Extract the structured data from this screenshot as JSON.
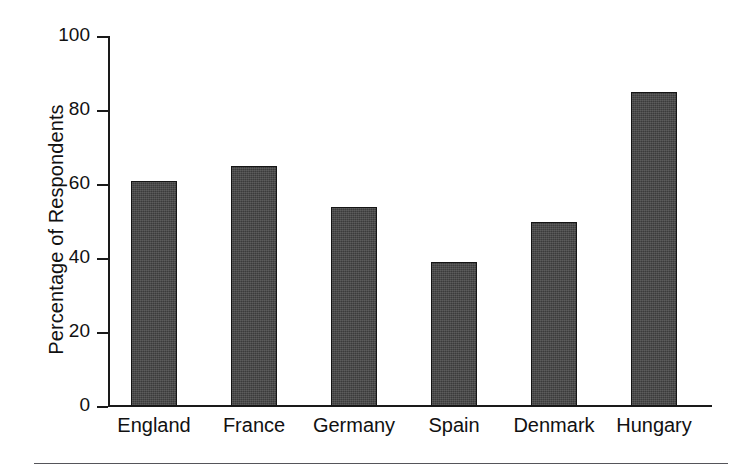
{
  "chart_data": {
    "type": "bar",
    "title": "",
    "xlabel": "",
    "ylabel": "Percentage of Respondents",
    "categories": [
      "England",
      "France",
      "Germany",
      "Spain",
      "Denmark",
      "Hungary"
    ],
    "values": [
      61,
      65,
      54,
      39,
      50,
      85
    ],
    "ylim": [
      0,
      100
    ],
    "yticks": [
      0,
      20,
      40,
      60,
      80,
      100
    ],
    "ytick_labels": [
      "0",
      "20",
      "40",
      "60",
      "80",
      "100"
    ],
    "grid": false,
    "legend": null,
    "bar_color": "#3b3b3b",
    "axis_color": "#1a1a1a",
    "background_color": "#ffffff"
  }
}
